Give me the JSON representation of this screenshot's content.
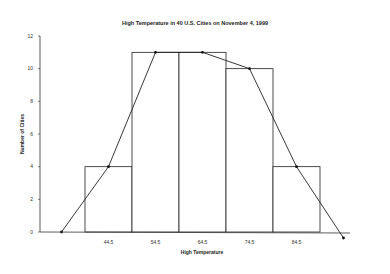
{
  "chart_data": {
    "type": "bar",
    "subtype": "histogram_with_frequency_polygon",
    "title": "High Temperature in 40 U.S. Cities on November 4, 1999",
    "xlabel": "High Temperature",
    "ylabel": "Number of Cities",
    "categories": [
      "44.5",
      "54.5",
      "64.5",
      "74.5",
      "84.5"
    ],
    "values": [
      4,
      11,
      11,
      10,
      4
    ],
    "ylim": [
      0,
      12
    ],
    "yticks": [
      0,
      2,
      4,
      6,
      8,
      10,
      12
    ],
    "grid": false,
    "legend": null,
    "series": [
      {
        "name": "Histogram",
        "type": "bar",
        "values": [
          4,
          11,
          11,
          10,
          4
        ]
      },
      {
        "name": "Frequency Polygon",
        "type": "line",
        "x": [
          "34.5",
          "44.5",
          "54.5",
          "64.5",
          "74.5",
          "84.5",
          "94.5"
        ],
        "values": [
          0,
          4,
          11,
          11,
          10,
          4,
          0
        ]
      }
    ]
  }
}
